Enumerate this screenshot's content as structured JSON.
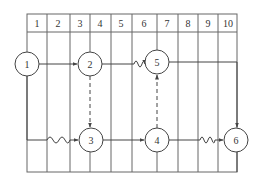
{
  "diagram": {
    "type": "time-scaled network diagram",
    "grid": {
      "left": 27,
      "right": 237,
      "top": 14,
      "header_bottom": 32,
      "bottom": 172,
      "column_lines": [
        27,
        47,
        70,
        90,
        111,
        132,
        157,
        178,
        198,
        218,
        237
      ],
      "column_labels": [
        "1",
        "2",
        "3",
        "4",
        "5",
        "6",
        "7",
        "8",
        "9",
        "10"
      ]
    },
    "nodes": [
      {
        "id": "1",
        "label": "1",
        "x": 27,
        "y": 64
      },
      {
        "id": "2",
        "label": "2",
        "x": 90,
        "y": 64
      },
      {
        "id": "5",
        "label": "5",
        "x": 157,
        "y": 62
      },
      {
        "id": "3",
        "label": "3",
        "x": 91,
        "y": 140
      },
      {
        "id": "4",
        "label": "4",
        "x": 157,
        "y": 140
      },
      {
        "id": "6",
        "label": "6",
        "x": 236,
        "y": 140
      }
    ],
    "node_radius": 12,
    "edges": [
      {
        "from": "1",
        "to": "2",
        "style": "solid"
      },
      {
        "from": "2",
        "to": "5",
        "style": "solid-wavy-end"
      },
      {
        "from": "1",
        "to": "3",
        "style": "solid-wavy-mid"
      },
      {
        "from": "3",
        "to": "4",
        "style": "solid"
      },
      {
        "from": "4",
        "to": "6",
        "style": "solid-wavy-end"
      },
      {
        "from": "2",
        "to": "3",
        "style": "dashed"
      },
      {
        "from": "4",
        "to": "5",
        "style": "dashed"
      },
      {
        "from": "5",
        "to": "6",
        "style": "solid-elbow"
      }
    ],
    "colors": {
      "line": "#555555",
      "text": "#333333",
      "background": "#ffffff"
    }
  }
}
